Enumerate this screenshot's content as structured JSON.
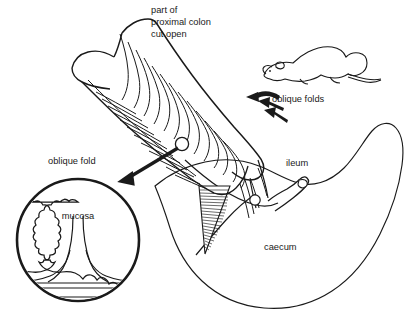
{
  "figure": {
    "name": "rodent-proximal-colon-caecum-diagram",
    "background_color": "#ffffff",
    "ink_color": "#1a1a1a",
    "width": 411,
    "height": 317
  },
  "labels": {
    "title_line1": "part of",
    "title_line2": "proximal colon",
    "title_line3": "cut open",
    "oblique_folds": "oblique folds",
    "oblique_fold": "oblique fold",
    "mucosa": "mucosa",
    "ileum": "ileum",
    "caecum": "caecum"
  },
  "icons": {
    "mouse": "mouse-silhouette-icon",
    "callout_marker": "callout-circle-marker-icon",
    "arrow_magnify": "magnifier-callout-arrow-icon",
    "arrow_fold_1": "fold-pointer-arrow-icon",
    "arrow_fold_2": "fold-pointer-arrow-icon",
    "arrow_fold_3": "fold-pointer-arrow-icon"
  },
  "parts": {
    "colon": "opened proximal colon trough with oblique mucosal folds",
    "caecum": "caecum sac outline",
    "ileum": "ileum tube stub",
    "inset": "magnified circular inset of a single oblique fold",
    "inset_layers": "submucosa and muscularis layer lines",
    "cut_wall_hatch": "hatched triangular cut wall of colon"
  }
}
